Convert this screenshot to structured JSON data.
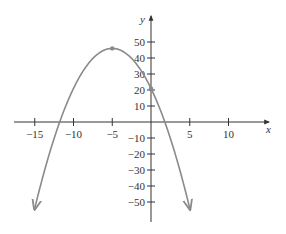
{
  "chart_data": {
    "type": "line",
    "title": "",
    "xlabel": "x",
    "ylabel": "y",
    "function": "y = -(x + 5)^2 + 46",
    "xlim": [
      -18,
      14
    ],
    "ylim": [
      -60,
      60
    ],
    "grid": false,
    "legend": null,
    "x_ticks": [
      -15,
      -10,
      -5,
      5,
      10
    ],
    "x_tick_labels": [
      "−15",
      "−10",
      "−5",
      "5",
      "10"
    ],
    "y_ticks": [
      50,
      40,
      30,
      20,
      10,
      -10,
      -20,
      -30,
      -40,
      -50
    ],
    "y_tick_labels": [
      "50",
      "40",
      "30",
      "20",
      "10",
      "−10",
      "−20",
      "−30",
      "−40",
      "−50"
    ],
    "series": [
      {
        "name": "parabola",
        "x": [
          -15,
          -14,
          -13,
          -12,
          -11,
          -10,
          -9,
          -8,
          -7,
          -6,
          -5,
          -4,
          -3,
          -2,
          -1,
          0,
          1,
          2,
          3,
          4,
          5
        ],
        "values": [
          -54,
          -35,
          -18,
          -3,
          10,
          21,
          30,
          37,
          42,
          45,
          46,
          45,
          42,
          37,
          30,
          21,
          10,
          -3,
          -18,
          -35,
          -54
        ],
        "color": "#8a8a8a",
        "end_arrows": true
      }
    ],
    "annotations": [
      {
        "type": "point",
        "label": "vertex",
        "x": -5,
        "y": 46
      },
      {
        "type": "point",
        "label": "y-intercept",
        "x": 0,
        "y": 21
      }
    ]
  },
  "colors": {
    "axis": "#333333",
    "curve": "#8a8a8a",
    "background": "#ffffff"
  }
}
